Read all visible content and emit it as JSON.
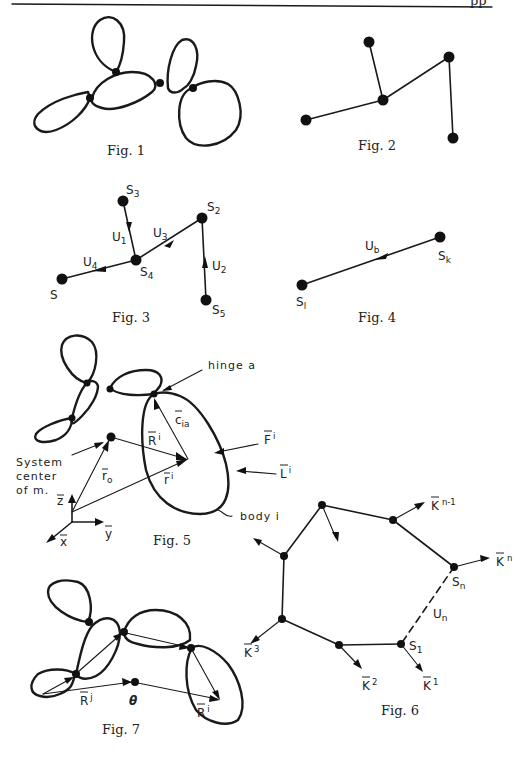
{
  "page": {
    "header_fragment": "pp"
  },
  "figures": [
    {
      "id": "fig1",
      "caption": "Fig. 1",
      "description": "Tree of six rigid bodies (closed outlines) connected by five hinge points"
    },
    {
      "id": "fig2",
      "caption": "Fig. 2",
      "description": "Graph of five nodes: star-like tree"
    },
    {
      "id": "fig3",
      "caption": "Fig. 3",
      "nodes": [
        "S3",
        "S2",
        "S4",
        "S",
        "S5"
      ],
      "node_labels": {
        "S3": {
          "base": "S",
          "sub": "3"
        },
        "S2": {
          "base": "S",
          "sub": "2"
        },
        "S4": {
          "base": "S",
          "sub": "4"
        },
        "S": {
          "base": "S",
          "sub": ""
        },
        "S5": {
          "base": "S",
          "sub": "5"
        }
      },
      "edges": [
        {
          "label_base": "U",
          "label_sub": "1",
          "from": "S3",
          "to": "S4"
        },
        {
          "label_base": "U",
          "label_sub": "3",
          "from": "S4",
          "to": "S2"
        },
        {
          "label_base": "U",
          "label_sub": "2",
          "from": "S5",
          "to": "S2"
        },
        {
          "label_base": "U",
          "label_sub": "4",
          "from": "S4",
          "to": "S"
        }
      ]
    },
    {
      "id": "fig4",
      "caption": "Fig. 4",
      "nodes": [
        {
          "base": "S",
          "sub": "k"
        },
        {
          "base": "S",
          "sub": "l"
        }
      ],
      "edge": {
        "label_base": "U",
        "label_sub": "b"
      }
    },
    {
      "id": "fig5",
      "caption": "Fig. 5",
      "labels": {
        "hinge": "hinge a",
        "system_center": [
          "System",
          "center",
          "of m."
        ],
        "c_ia": {
          "base": "c",
          "sub": "ia"
        },
        "R_i": {
          "base": "R",
          "sup": "i"
        },
        "r_o": {
          "base": "r",
          "sub": "o"
        },
        "r_i": {
          "base": "r",
          "sup": "i"
        },
        "F_i": {
          "base": "F",
          "sup": "i"
        },
        "L_i": {
          "base": "L",
          "sup": "i"
        },
        "body": "body i",
        "axis_z": "z",
        "axis_y": "y",
        "axis_x": "x"
      }
    },
    {
      "id": "fig6",
      "caption": "Fig. 6",
      "labels": {
        "K_n_1": {
          "base": "K",
          "sup": "n-1"
        },
        "K_n": {
          "base": "K",
          "sup": "n"
        },
        "S_n": {
          "base": "S",
          "sub": "n"
        },
        "U_n": {
          "base": "U",
          "sub": "n"
        },
        "S_1": {
          "base": "S",
          "sub": "1"
        },
        "K_3": {
          "base": "K",
          "sup": "3"
        },
        "K_2": {
          "base": "K",
          "sup": "2"
        },
        "K_1": {
          "base": "K",
          "sup": "1"
        }
      }
    },
    {
      "id": "fig7",
      "caption": "Fig. 7",
      "labels": {
        "R_j": {
          "base": "R",
          "sup": "j"
        },
        "theta": "θ",
        "R_i": {
          "base": "R",
          "sup": "i"
        }
      }
    }
  ]
}
